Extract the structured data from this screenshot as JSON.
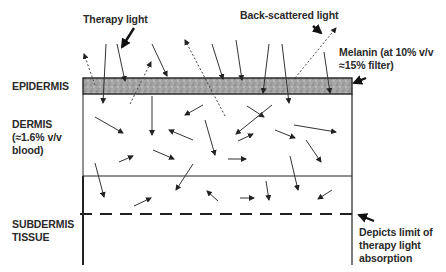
{
  "labels": {
    "therapy_light": "Therapy light",
    "back_scattered": "Back-scattered light",
    "melanin_line1": "Melanin (at 10% v/v",
    "melanin_line2": "≈15% filter)",
    "epidermis": "EPIDERMIS",
    "dermis_line1": "DERMIS",
    "dermis_line2": "(≈1.6% v/v",
    "dermis_line3": "blood)",
    "subdermis_line1": "SUBDERMIS",
    "subdermis_line2": "TISSUE",
    "limit_line1": "Depicts limit of",
    "limit_line2": "therapy light",
    "limit_line3": "absorption"
  },
  "layers": [
    {
      "name": "epidermis",
      "fill": "#9a9a9a"
    },
    {
      "name": "dermis",
      "fill": "#ffffff"
    },
    {
      "name": "subdermis",
      "fill": "#ffffff"
    }
  ],
  "colors": {
    "line": "#222222",
    "epidermis_fill": "#a0a0a0"
  }
}
